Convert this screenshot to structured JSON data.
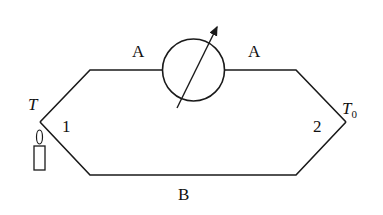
{
  "diagram": {
    "type": "thermocouple circuit",
    "labels": {
      "wire_top_left": "A",
      "wire_top_right": "A",
      "wire_bottom": "B",
      "junction_hot_temp": "T",
      "junction_cold_temp_base": "T",
      "junction_cold_temp_sub": "0",
      "junction_1": "1",
      "junction_2": "2"
    },
    "components": [
      "galvanometer (circle with diagonal arrow)",
      "candle heat source at junction 1"
    ],
    "colors": {
      "line": "#1a1a1a",
      "background": "#ffffff"
    }
  }
}
